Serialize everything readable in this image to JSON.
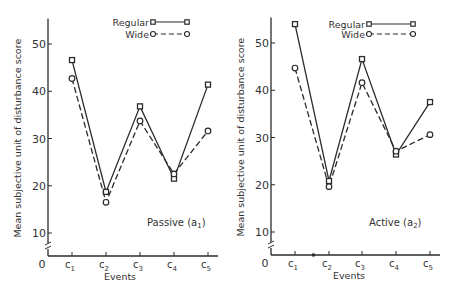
{
  "chart_data": [
    {
      "type": "line",
      "panel_label": "Passive (a1)",
      "panel_label_main": "Passive (a",
      "panel_label_sub": "1",
      "panel_label_close": ")",
      "xlabel": "Events",
      "ylabel": "Mean subjective unit of disturbance score",
      "categories": [
        "c1",
        "c2",
        "c3",
        "c4",
        "c5"
      ],
      "yticks": [
        10,
        20,
        30,
        40,
        50
      ],
      "origin_label": "0",
      "axis_break": true,
      "ylim": [
        5,
        55
      ],
      "grid": false,
      "legend": {
        "position": "top-right",
        "entries": [
          "Regular",
          "Wide"
        ]
      },
      "series": [
        {
          "name": "Regular",
          "marker": "square",
          "line": "solid",
          "values": [
            46.6,
            18.7,
            36.8,
            21.5,
            41.4
          ]
        },
        {
          "name": "Wide",
          "marker": "circle",
          "line": "dashed",
          "values": [
            42.7,
            16.5,
            33.7,
            22.5,
            31.6
          ]
        }
      ]
    },
    {
      "type": "line",
      "panel_label": "Active (a2)",
      "panel_label_main": "Active (a",
      "panel_label_sub": "2",
      "panel_label_close": ")",
      "xlabel": "Events",
      "ylabel": "Mean subjective unit of disturbance score",
      "categories": [
        "c1",
        "c2",
        "c3",
        "c4",
        "c5"
      ],
      "yticks": [
        10,
        20,
        30,
        40,
        50
      ],
      "origin_label": "0",
      "axis_break": true,
      "ylim": [
        5,
        55
      ],
      "grid": false,
      "legend": {
        "position": "top-right",
        "entries": [
          "Regular",
          "Wide"
        ]
      },
      "series": [
        {
          "name": "Regular",
          "marker": "square",
          "line": "solid",
          "values": [
            54.0,
            20.8,
            46.6,
            26.4,
            37.5
          ]
        },
        {
          "name": "Wide",
          "marker": "circle",
          "line": "dashed",
          "values": [
            44.7,
            19.6,
            41.6,
            27.1,
            30.6
          ]
        }
      ]
    }
  ]
}
